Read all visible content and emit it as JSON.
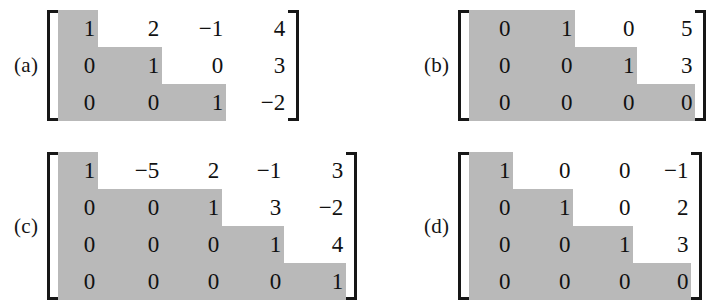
{
  "figure": {
    "background_color": "#ffffff",
    "shade_color": "#b9b9b9",
    "text_color": "#111111",
    "bracket_color": "#171717",
    "matrices": [
      {
        "label": "(a)",
        "rows": 3,
        "cols": 4,
        "values": [
          [
            "1",
            "2",
            "−1",
            "4"
          ],
          [
            "0",
            "1",
            "0",
            "3"
          ],
          [
            "0",
            "0",
            "1",
            "−2"
          ]
        ],
        "leading_one_columns": [
          1,
          2,
          3
        ]
      },
      {
        "label": "(b)",
        "rows": 3,
        "cols": 4,
        "values": [
          [
            "0",
            "1",
            "0",
            "5"
          ],
          [
            "0",
            "0",
            "1",
            "3"
          ],
          [
            "0",
            "0",
            "0",
            "0"
          ]
        ],
        "leading_one_columns": [
          2,
          3,
          4
        ]
      },
      {
        "label": "(c)",
        "rows": 4,
        "cols": 5,
        "values": [
          [
            "1",
            "−5",
            "2",
            "−1",
            "3"
          ],
          [
            "0",
            "0",
            "1",
            "3",
            "−2"
          ],
          [
            "0",
            "0",
            "0",
            "1",
            "4"
          ],
          [
            "0",
            "0",
            "0",
            "0",
            "1"
          ]
        ],
        "leading_one_columns": [
          1,
          3,
          4,
          5
        ]
      },
      {
        "label": "(d)",
        "rows": 4,
        "cols": 4,
        "values": [
          [
            "1",
            "0",
            "0",
            "−1"
          ],
          [
            "0",
            "1",
            "0",
            "2"
          ],
          [
            "0",
            "0",
            "1",
            "3"
          ],
          [
            "0",
            "0",
            "0",
            "0"
          ]
        ],
        "leading_one_columns": [
          1,
          2,
          3,
          4
        ]
      }
    ]
  }
}
